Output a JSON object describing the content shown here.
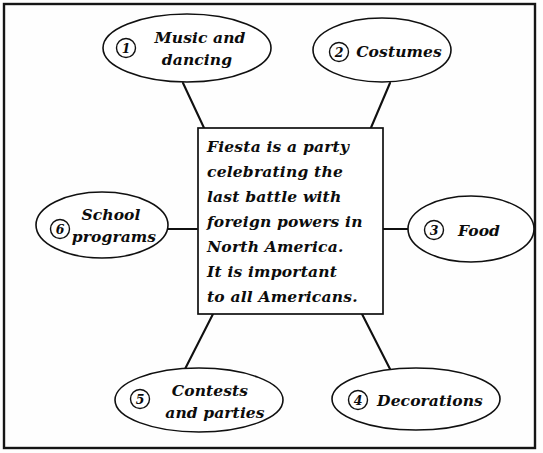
{
  "diagram": {
    "center": {
      "name": "center-topic-box",
      "lines": [
        "Fiesta is a party",
        "celebrating the",
        "last battle with",
        "foreign powers in",
        "North America.",
        "It is important",
        "to all Americans."
      ],
      "full_text": "Fiesta is a party celebrating the last battle with foreign powers in North America. It is important to all Americans."
    },
    "nodes": [
      {
        "number": "1",
        "name": "node-music-and-dancing",
        "lines": [
          "Music and",
          "dancing"
        ],
        "label": "Music and dancing",
        "position": "top-left"
      },
      {
        "number": "2",
        "name": "node-costumes",
        "lines": [
          "Costumes"
        ],
        "label": "Costumes",
        "position": "top-right"
      },
      {
        "number": "3",
        "name": "node-food",
        "lines": [
          "Food"
        ],
        "label": "Food",
        "position": "right"
      },
      {
        "number": "4",
        "name": "node-decorations",
        "lines": [
          "Decorations"
        ],
        "label": "Decorations",
        "position": "bottom-right"
      },
      {
        "number": "5",
        "name": "node-contests-and-parties",
        "lines": [
          "Contests",
          "and parties"
        ],
        "label": "Contests and parties",
        "position": "bottom-left"
      },
      {
        "number": "6",
        "name": "node-school-programs",
        "lines": [
          "School",
          "programs"
        ],
        "label": "School programs",
        "position": "left"
      }
    ],
    "colors": {
      "background": "#fefefe",
      "ink": "#101010",
      "shape_fill": "#ffffff"
    }
  }
}
